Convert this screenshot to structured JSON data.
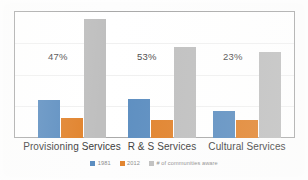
{
  "chart_data": {
    "type": "bar",
    "title": "",
    "subtitle": "",
    "xlabel": "",
    "ylabel": "",
    "grid": true,
    "legend_position": "bottom",
    "ylim": [
      0,
      100
    ],
    "categories": [
      "Provisioning Services",
      "R & S Services",
      "Cultural Services"
    ],
    "series": [
      {
        "name": "1981",
        "color": "#5B8DC0",
        "values": [
          30,
          31,
          21
        ]
      },
      {
        "name": "2012",
        "color": "#E1822B",
        "values": [
          16,
          14,
          14
        ]
      },
      {
        "name": "# of communities aware",
        "color": "#BFBFBF",
        "values": [
          94,
          72,
          68
        ]
      }
    ],
    "annotations": [
      {
        "text": "47%",
        "category": "Provisioning Services"
      },
      {
        "text": "53%",
        "category": "R & S Services"
      },
      {
        "text": "23%",
        "category": "Cultural Services"
      }
    ]
  },
  "legend": {
    "items": [
      {
        "label": "1981",
        "color": "#5B8DC0"
      },
      {
        "label": "2012",
        "color": "#E1822B"
      },
      {
        "label": "# of communities aware",
        "color": "#BFBFBF"
      }
    ]
  },
  "colors": {
    "series_1981": "#5B8DC0",
    "series_2012": "#E1822B",
    "series_aware": "#BFBFBF",
    "frame": "#a8a8a8",
    "gridline": "#f0f0f0",
    "label_text": "#4a4a4a",
    "category_text": "#3a3a3a",
    "legend_text": "#8a8a8a"
  }
}
